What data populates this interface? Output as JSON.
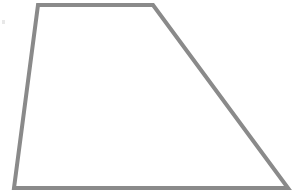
{
  "canvas": {
    "width": 301,
    "height": 194,
    "background_color": "#ffffff",
    "alt_text": "Line drawing of a trapezoid (quadrilateral) outlined in gray on a white background"
  },
  "figure": {
    "name": "trapezoid",
    "shape_type": "quadrilateral",
    "stroke_color": "#8a8a8a",
    "stroke_width": 4,
    "fill_color": "none",
    "vertices": [
      {
        "label": "top-left",
        "x": 38,
        "y": 5
      },
      {
        "label": "top-right",
        "x": 153,
        "y": 5
      },
      {
        "label": "bottom-right",
        "x": 288,
        "y": 188
      },
      {
        "label": "bottom-left",
        "x": 14,
        "y": 188
      }
    ],
    "points_attr": "38,5 153,5 288,188 14,188",
    "edges": [
      {
        "name": "top-edge",
        "from": "top-left",
        "to": "top-right"
      },
      {
        "name": "right-edge",
        "from": "top-right",
        "to": "bottom-right"
      },
      {
        "name": "bottom-edge",
        "from": "bottom-right",
        "to": "bottom-left"
      },
      {
        "name": "left-edge",
        "from": "bottom-left",
        "to": "top-left"
      }
    ]
  },
  "artifacts": {
    "speck": {
      "x": 2,
      "y": 20,
      "width": 3,
      "height": 4,
      "color": "#e8e8e8"
    }
  },
  "labels": {
    "none": ""
  }
}
